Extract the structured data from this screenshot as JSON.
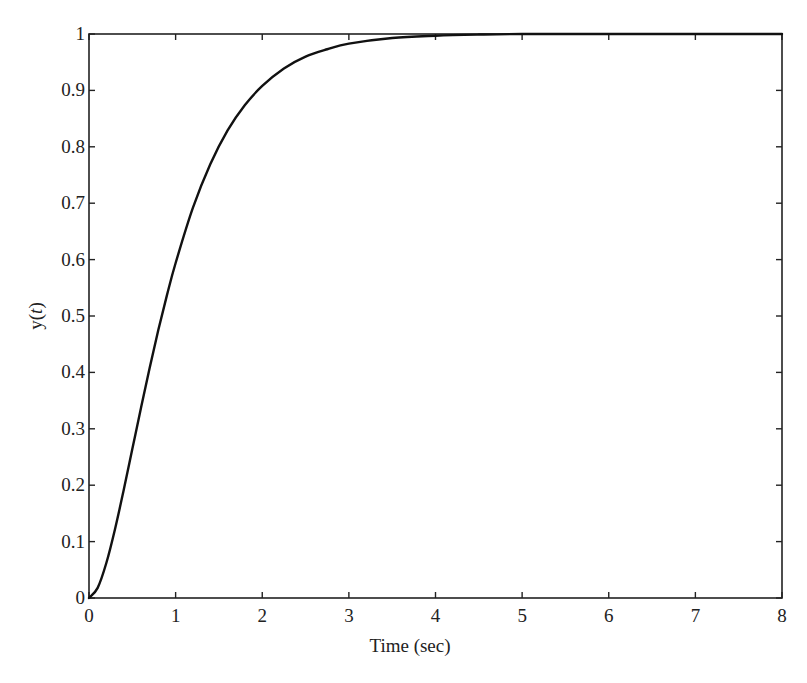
{
  "chart_data": {
    "type": "line",
    "title": "",
    "xlabel": "Time (sec)",
    "ylabel": "y(t)",
    "ylabel_parts": {
      "pre": "y(",
      "var": "t",
      "post": ")"
    },
    "xlim": [
      0,
      8
    ],
    "ylim": [
      0,
      1
    ],
    "grid": false,
    "legend": null,
    "x_ticks": [
      0,
      1,
      2,
      3,
      4,
      5,
      6,
      7,
      8
    ],
    "x_tick_labels": [
      "0",
      "1",
      "2",
      "3",
      "4",
      "5",
      "6",
      "7",
      "8"
    ],
    "y_ticks": [
      0,
      0.1,
      0.2,
      0.3,
      0.4,
      0.5,
      0.6,
      0.7,
      0.8,
      0.9,
      1
    ],
    "y_tick_labels": [
      "0",
      "0.1",
      "0.2",
      "0.3",
      "0.4",
      "0.5",
      "0.6",
      "0.7",
      "0.8",
      "0.9",
      "1"
    ],
    "series": [
      {
        "name": "y(t)",
        "color": "#111111",
        "x": [
          0,
          0.1,
          0.2,
          0.3,
          0.4,
          0.5,
          0.6,
          0.7,
          0.8,
          0.9,
          1.0,
          1.2,
          1.4,
          1.6,
          1.8,
          2.0,
          2.25,
          2.5,
          2.75,
          3.0,
          3.5,
          4.0,
          4.5,
          5.0,
          6.0,
          7.0,
          8.0
        ],
        "values": [
          0,
          0.018,
          0.062,
          0.122,
          0.191,
          0.264,
          0.337,
          0.408,
          0.475,
          0.537,
          0.594,
          0.692,
          0.769,
          0.829,
          0.874,
          0.908,
          0.939,
          0.96,
          0.973,
          0.983,
          0.993,
          0.997,
          0.999,
          1.0,
          1.0,
          1.0,
          1.0
        ]
      }
    ]
  }
}
